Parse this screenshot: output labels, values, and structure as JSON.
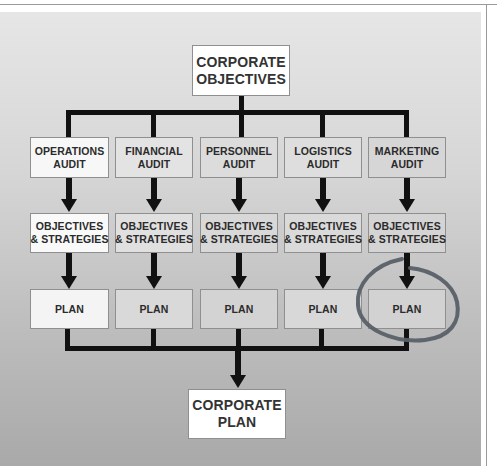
{
  "diagram": {
    "top": {
      "line1": "CORPORATE",
      "line2": "OBJECTIVES"
    },
    "bottom": {
      "line1": "CORPORATE",
      "line2": "PLAN"
    },
    "columns": [
      {
        "audit": {
          "line1": "OPERATIONS",
          "line2": "AUDIT"
        },
        "objectives": {
          "line1": "OBJECTIVES",
          "line2": "& STRATEGIES"
        },
        "plan": "PLAN",
        "highlighted": false
      },
      {
        "audit": {
          "line1": "FINANCIAL",
          "line2": "AUDIT"
        },
        "objectives": {
          "line1": "OBJECTIVES",
          "line2": "& STRATEGIES"
        },
        "plan": "PLAN",
        "highlighted": false
      },
      {
        "audit": {
          "line1": "PERSONNEL",
          "line2": "AUDIT"
        },
        "objectives": {
          "line1": "OBJECTIVES",
          "line2": "& STRATEGIES"
        },
        "plan": "PLAN",
        "highlighted": false
      },
      {
        "audit": {
          "line1": "LOGISTICS",
          "line2": "AUDIT"
        },
        "objectives": {
          "line1": "OBJECTIVES",
          "line2": "& STRATEGIES"
        },
        "plan": "PLAN",
        "highlighted": false
      },
      {
        "audit": {
          "line1": "MARKETING",
          "line2": "AUDIT"
        },
        "objectives": {
          "line1": "OBJECTIVES",
          "line2": "& STRATEGIES"
        },
        "plan": "PLAN",
        "highlighted": true
      }
    ],
    "colors": {
      "connector": "#111111",
      "highlight_ring": "#5a6068",
      "box_border": "#8f8f8f",
      "text": "#2b2b2b"
    }
  }
}
